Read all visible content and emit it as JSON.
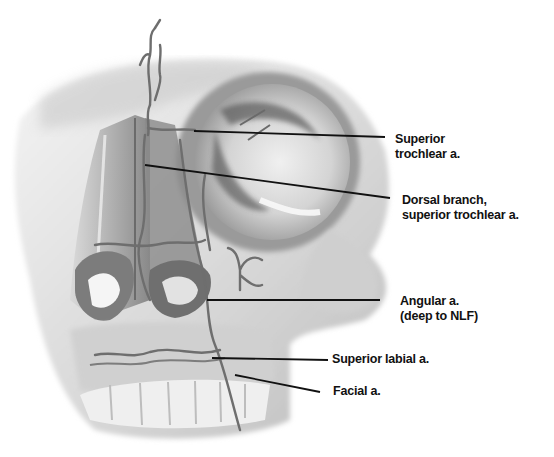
{
  "figure": {
    "labels": [
      {
        "id": "superior-trochlear",
        "line1": "Superior",
        "line2": "trochlear a."
      },
      {
        "id": "dorsal-branch",
        "line1": "Dorsal branch,",
        "line2": "superior trochlear a."
      },
      {
        "id": "angular",
        "line1": "Angular a.",
        "line2": "(deep to NLF)"
      },
      {
        "id": "superior-labial",
        "line1": "Superior labial a.",
        "line2": ""
      },
      {
        "id": "facial",
        "line1": "Facial a.",
        "line2": ""
      }
    ],
    "colors": {
      "background": "#ffffff",
      "bone_light": "#e6e6e6",
      "bone_mid": "#b5b5b5",
      "bone_dark": "#5a5a5a",
      "vessel": "#6e6e6e",
      "leader_line": "#111111",
      "label_text": "#111111"
    }
  }
}
